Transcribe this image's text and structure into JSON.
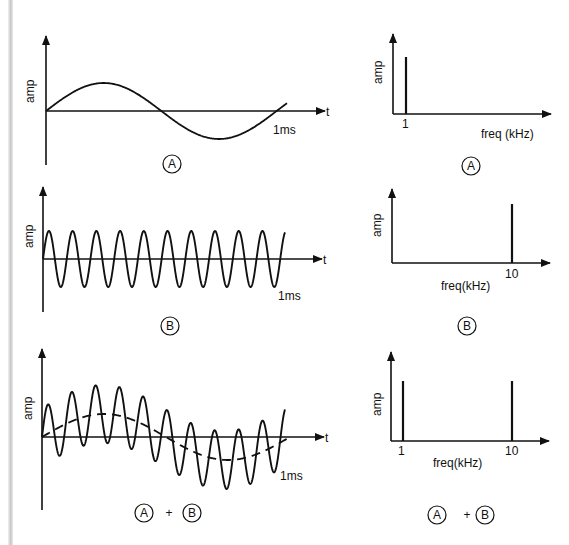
{
  "figure": {
    "time_axis_label": "t",
    "amp_label": "amp",
    "time_tick": "1ms",
    "freq_axis_label": "freq (kHz)",
    "freq_axis_label_compact": "freq(kHz)",
    "panels": [
      {
        "id": "A",
        "caption_parts": [
          "A"
        ],
        "time_signal": "sine 1 kHz, 1 cycle in 1 ms",
        "spectrum_lines_khz": [
          "1"
        ]
      },
      {
        "id": "B",
        "caption_parts": [
          "B"
        ],
        "time_signal": "sine 10 kHz, 10 cycles in 1 ms",
        "spectrum_lines_khz": [
          "10"
        ]
      },
      {
        "id": "A+B",
        "caption_parts": [
          "A",
          "+",
          "B"
        ],
        "time_signal": "sum of A and B (A shown dashed)",
        "spectrum_lines_khz": [
          "1",
          "10"
        ]
      }
    ]
  },
  "chart_data": [
    {
      "type": "line",
      "title": "A (time domain)",
      "xlabel": "t",
      "ylabel": "amp",
      "x_tick": "1ms",
      "series": [
        {
          "name": "A",
          "frequency_khz": 1,
          "cycles": 1
        }
      ]
    },
    {
      "type": "bar",
      "title": "A (frequency domain)",
      "xlabel": "freq (kHz)",
      "ylabel": "amp",
      "categories": [
        "1"
      ],
      "values": [
        1
      ]
    },
    {
      "type": "line",
      "title": "B (time domain)",
      "xlabel": "t",
      "ylabel": "amp",
      "x_tick": "1ms",
      "series": [
        {
          "name": "B",
          "frequency_khz": 10,
          "cycles": 10
        }
      ]
    },
    {
      "type": "bar",
      "title": "B (frequency domain)",
      "xlabel": "freq(kHz)",
      "ylabel": "amp",
      "categories": [
        "10"
      ],
      "values": [
        1
      ]
    },
    {
      "type": "line",
      "title": "A + B (time domain)",
      "xlabel": "t",
      "ylabel": "amp",
      "x_tick": "1ms",
      "series": [
        {
          "name": "A+B",
          "style": "solid"
        },
        {
          "name": "A",
          "style": "dashed"
        }
      ]
    },
    {
      "type": "bar",
      "title": "A + B (frequency domain)",
      "xlabel": "freq(kHz)",
      "ylabel": "amp",
      "categories": [
        "1",
        "10"
      ],
      "values": [
        1,
        1
      ]
    }
  ]
}
